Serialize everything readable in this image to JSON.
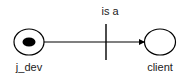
{
  "diagram": {
    "type": "petri-net",
    "places": [
      {
        "id": "j_dev",
        "label": "j_dev",
        "marked": true
      },
      {
        "id": "client",
        "label": "client",
        "marked": false
      }
    ],
    "transitions": [
      {
        "id": "is_a",
        "label": "is a"
      }
    ],
    "arcs": [
      {
        "from": "j_dev",
        "to": "client",
        "via": "is_a"
      }
    ],
    "colors": {
      "stroke": "#000000",
      "background": "#ffffff",
      "text": "#222222"
    }
  }
}
